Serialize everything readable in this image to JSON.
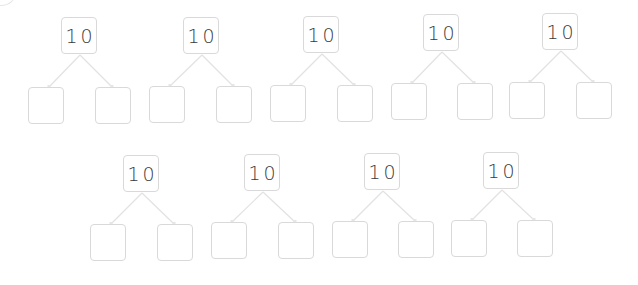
{
  "worksheet": {
    "title": "",
    "bonds": [
      {
        "whole": "10",
        "part_a": "",
        "part_b": "",
        "top": [
          61,
          17
        ],
        "left": [
          28,
          87
        ],
        "right": [
          95,
          87
        ]
      },
      {
        "whole": "10",
        "part_a": "",
        "part_b": "",
        "top": [
          183,
          17
        ],
        "left": [
          149,
          86
        ],
        "right": [
          216,
          86
        ]
      },
      {
        "whole": "10",
        "part_a": "",
        "part_b": "",
        "top": [
          303,
          16
        ],
        "left": [
          270,
          85
        ],
        "right": [
          337,
          85
        ]
      },
      {
        "whole": "10",
        "part_a": "",
        "part_b": "",
        "top": [
          423,
          14
        ],
        "left": [
          391,
          83
        ],
        "right": [
          457,
          83
        ]
      },
      {
        "whole": "10",
        "part_a": "",
        "part_b": "",
        "top": [
          542,
          13
        ],
        "left": [
          509,
          82
        ],
        "right": [
          576,
          82
        ]
      },
      {
        "whole": "10",
        "part_a": "",
        "part_b": "",
        "top": [
          123,
          155
        ],
        "left": [
          90,
          224
        ],
        "right": [
          157,
          224
        ]
      },
      {
        "whole": "10",
        "part_a": "",
        "part_b": "",
        "top": [
          244,
          154
        ],
        "left": [
          211,
          222
        ],
        "right": [
          278,
          222
        ]
      },
      {
        "whole": "10",
        "part_a": "",
        "part_b": "",
        "top": [
          364,
          153
        ],
        "left": [
          332,
          221
        ],
        "right": [
          398,
          221
        ]
      },
      {
        "whole": "10",
        "part_a": "",
        "part_b": "",
        "top": [
          483,
          152
        ],
        "left": [
          451,
          220
        ],
        "right": [
          517,
          220
        ]
      }
    ]
  },
  "colors": {
    "box_border": "#d9d9d9",
    "line": "#e2e2e2",
    "text": "#3a3a3a"
  },
  "icons": {
    "connector": "arrow-line-icon"
  }
}
